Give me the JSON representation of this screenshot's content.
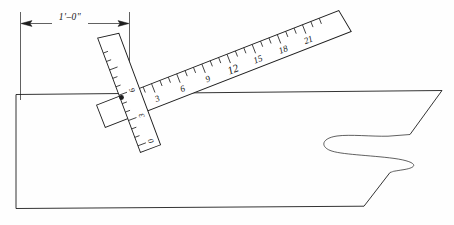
{
  "drawing": {
    "title": "Hand-drawn hull section with two scales",
    "ink_color": "#1d1d1d",
    "paper_color": "#fefefe"
  },
  "dimension": {
    "label": "1'–0\"",
    "arrow_left_name": "dimension-arrow-left",
    "arrow_right_name": "dimension-arrow-right"
  },
  "pivot": {
    "marker_name": "pivot-dot",
    "x": 121.5,
    "y": 97.5
  },
  "diagonal_scale": {
    "name": "diagonal-ruler",
    "zero_label": "0",
    "labels": [
      "0",
      "3",
      "6",
      "9",
      "12",
      "15",
      "18",
      "21"
    ],
    "major_interval": 3,
    "minor_per_major": 3,
    "units": "inches"
  },
  "vertical_scale": {
    "name": "vertical-ruler",
    "labels": [
      "0",
      "3",
      "6"
    ],
    "major_interval": 3,
    "minor_per_major": 3,
    "units": "inches"
  },
  "hull": {
    "outline_name": "hull-outline",
    "curve_name": "hull-curve-profile",
    "deck_line_name": "hull-deck-line",
    "keel_line_name": "hull-keel-line"
  }
}
